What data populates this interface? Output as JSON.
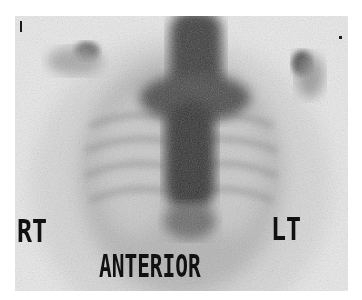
{
  "image": {
    "type": "nuclear-medicine-bone-scan",
    "view_label": "ANTERIOR",
    "side_labels": {
      "right": "RT",
      "left": "LT"
    },
    "colors": {
      "background": "#e9e9e9",
      "uptake_dark": "#2b2b2b",
      "uptake_mid": "#6e6e6e",
      "text": "#111111"
    }
  }
}
